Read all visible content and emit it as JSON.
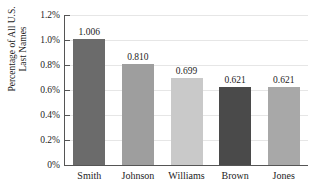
{
  "chart_data": {
    "type": "bar",
    "title": "Most Common U.S. Last Names",
    "xlabel": "",
    "ylabel_line1": "Percentage of All U.S.",
    "ylabel_line2": "Last Names",
    "categories": [
      "Smith",
      "Johnson",
      "Williams",
      "Brown",
      "Jones"
    ],
    "values": [
      1.006,
      0.81,
      0.699,
      0.621,
      0.621
    ],
    "value_labels": [
      "1.006",
      "0.810",
      "0.699",
      "0.621",
      "0.621"
    ],
    "bar_colors": [
      "#6b6b6b",
      "#9e9e9e",
      "#c9c9c9",
      "#4a4a4a",
      "#a8a8a8"
    ],
    "ylim": [
      0,
      1.2
    ],
    "ytick_values": [
      0,
      0.2,
      0.4,
      0.6,
      0.8,
      1.0,
      1.2
    ],
    "ytick_labels": [
      "0%",
      "0.2%",
      "0.4%",
      "0.6%",
      "0.8%",
      "1.0%",
      "1.2%"
    ],
    "grid": true,
    "legend": "none",
    "axis_color": "#555555",
    "gridline_color": "#e6e6e6",
    "text_color": "#1d1d1d",
    "background": "#ffffff"
  }
}
